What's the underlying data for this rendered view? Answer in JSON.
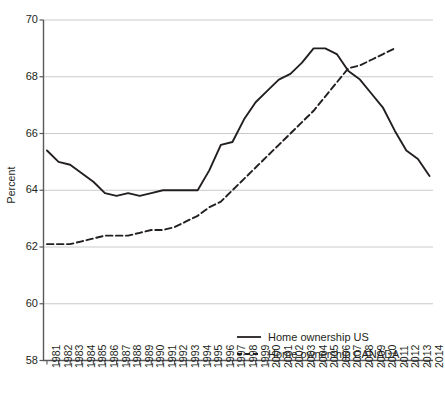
{
  "chart_data": {
    "type": "line",
    "title": "",
    "xlabel": "",
    "ylabel": "Percent",
    "ylim": [
      58,
      70
    ],
    "ytick_values": [
      58,
      60,
      62,
      64,
      66,
      68,
      70
    ],
    "ytick_labels": [
      "58",
      "60",
      "62",
      "64",
      "66",
      "68",
      "70"
    ],
    "grid": true,
    "grid_axis": "y",
    "legend_position": "bottom-right",
    "categories": [
      "1981",
      "1982",
      "1983",
      "1984",
      "1985",
      "1986",
      "1987",
      "1988",
      "1989",
      "1990",
      "1991",
      "1992",
      "1993",
      "1994",
      "1995",
      "1996",
      "1997",
      "1998",
      "1999",
      "2000",
      "2001",
      "2002",
      "2003",
      "2004",
      "2005",
      "2006",
      "2007",
      "2008",
      "2009",
      "2010",
      "2011",
      "2012",
      "2013",
      "2014"
    ],
    "series": [
      {
        "name": "Home ownership US",
        "style": "solid",
        "color": "#231f20",
        "values": [
          65.4,
          65.0,
          64.9,
          64.6,
          64.3,
          63.9,
          63.8,
          63.9,
          63.8,
          63.9,
          64.0,
          64.0,
          64.0,
          64.0,
          64.7,
          65.6,
          65.7,
          66.5,
          67.1,
          67.5,
          67.9,
          68.1,
          68.5,
          69.0,
          69.0,
          68.8,
          68.2,
          67.9,
          67.4,
          66.9,
          66.1,
          65.4,
          65.1,
          64.5
        ]
      },
      {
        "name": "Home ownership CANADA",
        "style": "dashed",
        "color": "#231f20",
        "values": [
          62.1,
          62.1,
          62.1,
          62.2,
          62.3,
          62.4,
          62.4,
          62.4,
          62.5,
          62.6,
          62.6,
          62.7,
          62.9,
          63.1,
          63.4,
          63.6,
          64.0,
          64.4,
          64.8,
          65.2,
          65.6,
          66.0,
          66.4,
          66.8,
          67.3,
          67.8,
          68.3,
          68.4,
          68.6,
          68.8,
          69.0,
          null,
          null,
          null
        ]
      }
    ]
  },
  "legend": {
    "items": [
      {
        "label": "Home ownership US",
        "style": "solid"
      },
      {
        "label": "Home ownership CANADA",
        "style": "dashed"
      }
    ]
  }
}
